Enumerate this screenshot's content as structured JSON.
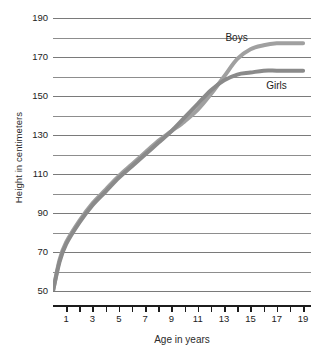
{
  "chart_data": {
    "type": "line",
    "title": "",
    "xlabel": "Age in years",
    "ylabel": "Height in centimeters",
    "xlim": [
      0,
      19.6
    ],
    "ylim": [
      50,
      190
    ],
    "grid": true,
    "legend_position": "inline-annotation",
    "y_gridline_values": [
      190,
      180,
      170,
      160,
      150,
      140,
      130,
      120,
      110,
      100,
      90,
      80,
      70,
      60,
      50
    ],
    "y_tick_labels": [
      "190",
      "170",
      "150",
      "130",
      "110",
      "90",
      "70",
      "50"
    ],
    "y_labeled_values": [
      190,
      170,
      150,
      130,
      110,
      90,
      70,
      50
    ],
    "x_tick_values": [
      1,
      2,
      3,
      4,
      5,
      6,
      7,
      8,
      9,
      10,
      11,
      12,
      13,
      14,
      15,
      16,
      17,
      18,
      19
    ],
    "x_tick_labels": [
      "1",
      "3",
      "5",
      "7",
      "9",
      "11",
      "13",
      "15",
      "17",
      "19"
    ],
    "x_labeled_values": [
      1,
      3,
      5,
      7,
      9,
      11,
      13,
      15,
      17,
      19
    ],
    "x": [
      0,
      0.5,
      1,
      2,
      3,
      4,
      5,
      6,
      7,
      8,
      9,
      10,
      11,
      12,
      13,
      14,
      15,
      16,
      17,
      18,
      19
    ],
    "series": [
      {
        "name": "Boys",
        "color": "#a0a0a0",
        "label_x": 13.1,
        "label_y": 180,
        "values": [
          50,
          66,
          75,
          86,
          95,
          102,
          109,
          115,
          121,
          127,
          132,
          137,
          143,
          151,
          160,
          169,
          174,
          176,
          177,
          177,
          177
        ]
      },
      {
        "name": "Girls",
        "color": "#8a8a8a",
        "label_x": 16.2,
        "label_y": 155,
        "values": [
          50,
          65,
          74,
          85,
          94,
          101,
          108,
          114,
          120,
          126,
          132,
          139,
          146,
          153,
          158,
          161,
          162,
          163,
          163,
          163,
          163
        ]
      }
    ],
    "axis_color": "#1c1c1c",
    "gridline_color": "#8d8d8d",
    "background_color": "#ffffff"
  }
}
